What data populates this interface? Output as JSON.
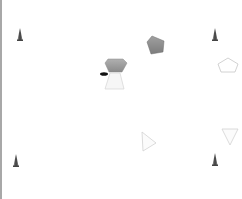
{
  "scene": {
    "background": "#ffffff",
    "border_color": "#a8a8a8",
    "objects": [
      {
        "type": "cone",
        "name": "cone-marker-top-left",
        "x": 20,
        "y": 30,
        "color": "#555555"
      },
      {
        "type": "cone",
        "name": "cone-marker-top-right",
        "x": 215,
        "y": 33,
        "color": "#555555"
      },
      {
        "type": "cone",
        "name": "cone-marker-bottom-left",
        "x": 16,
        "y": 160,
        "color": "#555555"
      },
      {
        "type": "cone",
        "name": "cone-marker-bottom-right",
        "x": 214,
        "y": 158,
        "color": "#555555"
      },
      {
        "type": "pentagon",
        "name": "gray-pentagon-top",
        "x": 155,
        "y": 44,
        "fill": "#8c8c8c"
      },
      {
        "type": "pentagon",
        "name": "gray-pentagon-center",
        "x": 115,
        "y": 65,
        "fill": "#9a9a9a"
      },
      {
        "type": "triangle",
        "name": "light-triangle-center",
        "x": 114,
        "y": 82,
        "stroke": "#d0d0d0"
      },
      {
        "type": "oval",
        "name": "black-agent",
        "x": 104,
        "y": 74,
        "fill": "#111111"
      },
      {
        "type": "pentagon-outline",
        "name": "outline-pentagon-right",
        "x": 228,
        "y": 65,
        "stroke": "#c8c8c8"
      },
      {
        "type": "triangle-outline",
        "name": "outline-triangle-right-pointing",
        "x": 148,
        "y": 142,
        "stroke": "#d0d0d0"
      },
      {
        "type": "triangle-outline",
        "name": "outline-triangle-down-pointing",
        "x": 229,
        "y": 136,
        "stroke": "#d0d0d0"
      }
    ]
  }
}
